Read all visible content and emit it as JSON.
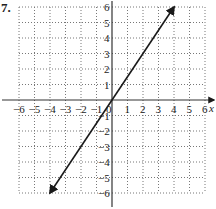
{
  "problem_label": "7.",
  "chart_data": {
    "type": "line",
    "title": "",
    "xlabel": "x",
    "ylabel": "",
    "xlim": [
      -6,
      6
    ],
    "ylim": [
      -6,
      6
    ],
    "grid": true,
    "x_ticks": [
      -6,
      -5,
      -4,
      -3,
      -2,
      -1,
      0,
      1,
      2,
      3,
      4,
      5,
      6
    ],
    "y_ticks": [
      -6,
      -5,
      -4,
      -3,
      -2,
      -1,
      1,
      2,
      3,
      4,
      5,
      6
    ],
    "x_tick_labels": [
      "−6",
      "−5",
      "−4",
      "−3",
      "−2",
      "−1",
      "0",
      "1",
      "2",
      "3",
      "4",
      "5",
      "6"
    ],
    "y_tick_labels": [
      "−6",
      "−5",
      "−4",
      "−3",
      "−2",
      "−1",
      "1",
      "2",
      "3",
      "4",
      "5",
      "6"
    ],
    "series": [
      {
        "name": "y = 1.5x",
        "x": [
          -4,
          4
        ],
        "y": [
          -6,
          6
        ],
        "arrows": "both",
        "color": "#1a1a1a"
      }
    ]
  }
}
